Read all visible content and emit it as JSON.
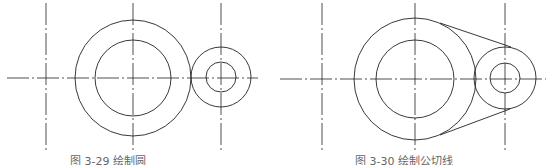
{
  "figures": [
    {
      "caption": "图 3-29  绘制圆",
      "center_line_y": 78,
      "h_line": [
        7,
        258
      ],
      "v_lines_x": [
        46,
        133,
        221
      ],
      "circles": [
        {
          "cx": 133,
          "cy": 78,
          "r": 58
        },
        {
          "cx": 133,
          "cy": 78,
          "r": 38
        },
        {
          "cx": 221,
          "cy": 77,
          "r": 30
        },
        {
          "cx": 221,
          "cy": 77,
          "r": 15
        }
      ]
    },
    {
      "caption": "图 3-30  绘制公切线",
      "center_line_y": 79,
      "h_line": [
        280,
        546
      ],
      "v_lines_x": [
        322,
        415,
        505
      ],
      "circles": [
        {
          "cx": 415,
          "cy": 79,
          "r": 61
        },
        {
          "cx": 415,
          "cy": 79,
          "r": 39
        },
        {
          "cx": 505,
          "cy": 78,
          "r": 31
        },
        {
          "cx": 505,
          "cy": 78,
          "r": 15
        }
      ],
      "tangents": [
        {
          "x1": 440,
          "y1": 23,
          "x2": 511,
          "y2": 47
        },
        {
          "x1": 440,
          "y1": 135,
          "x2": 510,
          "y2": 109
        }
      ]
    }
  ],
  "colors": {
    "stroke": "#222222",
    "caption": "#666666"
  }
}
